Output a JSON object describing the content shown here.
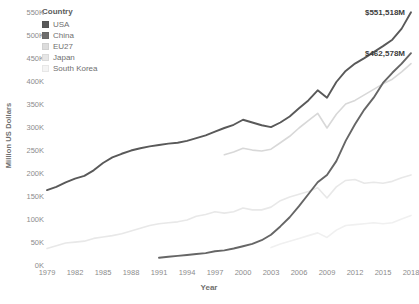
{
  "chart_data": {
    "type": "line",
    "title": "",
    "xlabel": "Year",
    "ylabel": "Million US Dollars",
    "xlim": [
      1979,
      2018
    ],
    "ylim": [
      0,
      550000
    ],
    "grid": false,
    "legend_position": "top-left",
    "legend_title": "Country",
    "x_tick_labels": [
      "1979",
      "1982",
      "1985",
      "1988",
      "1991",
      "1994",
      "1997",
      "2000",
      "2003",
      "2006",
      "2009",
      "2012",
      "2015",
      "2018"
    ],
    "x_tick_values": [
      1979,
      1982,
      1985,
      1988,
      1991,
      1994,
      1997,
      2000,
      2003,
      2006,
      2009,
      2012,
      2015,
      2018
    ],
    "y_tick_labels": [
      "0K",
      "50K",
      "100K",
      "150K",
      "200K",
      "250K",
      "300K",
      "350K",
      "400K",
      "450K",
      "500K",
      "550K"
    ],
    "y_tick_values": [
      0,
      50000,
      100000,
      150000,
      200000,
      250000,
      300000,
      350000,
      400000,
      450000,
      500000,
      550000
    ],
    "x": [
      1979,
      1980,
      1981,
      1982,
      1983,
      1984,
      1985,
      1986,
      1987,
      1988,
      1989,
      1990,
      1991,
      1992,
      1993,
      1994,
      1995,
      1996,
      1997,
      1998,
      1999,
      2000,
      2001,
      2002,
      2003,
      2004,
      2005,
      2006,
      2007,
      2008,
      2009,
      2010,
      2011,
      2012,
      2013,
      2014,
      2015,
      2016,
      2017,
      2018
    ],
    "series": [
      {
        "name": "USA",
        "color": "#595959",
        "width": 1.9,
        "values": [
          165000,
          172000,
          182000,
          190000,
          196000,
          208000,
          224000,
          236000,
          244000,
          251000,
          256000,
          260000,
          263000,
          266000,
          268000,
          272000,
          278000,
          284000,
          292000,
          300000,
          307000,
          318000,
          312000,
          306000,
          302000,
          312000,
          325000,
          343000,
          360000,
          382000,
          366000,
          400000,
          424000,
          440000,
          452000,
          465000,
          478000,
          492000,
          516000,
          551518
        ]
      },
      {
        "name": "China",
        "color": "#666666",
        "width": 1.9,
        "values": [
          null,
          null,
          null,
          null,
          null,
          null,
          null,
          null,
          null,
          null,
          null,
          null,
          18000,
          20000,
          22000,
          24000,
          26000,
          28000,
          32000,
          34000,
          38000,
          43000,
          48000,
          56000,
          68000,
          86000,
          106000,
          130000,
          156000,
          182000,
          198000,
          228000,
          272000,
          308000,
          340000,
          366000,
          398000,
          420000,
          440000,
          462578
        ]
      },
      {
        "name": "EU27",
        "color": "#d8d8d8",
        "width": 1.6,
        "values": [
          null,
          null,
          null,
          null,
          null,
          null,
          null,
          null,
          null,
          null,
          null,
          null,
          null,
          null,
          null,
          null,
          null,
          null,
          null,
          242000,
          248000,
          256000,
          252000,
          250000,
          254000,
          268000,
          282000,
          300000,
          316000,
          332000,
          300000,
          330000,
          352000,
          360000,
          372000,
          384000,
          396000,
          406000,
          422000,
          440000
        ]
      },
      {
        "name": "Japan",
        "color": "#e8e8e8",
        "width": 1.6,
        "values": [
          38000,
          44000,
          50000,
          52000,
          54000,
          60000,
          63000,
          66000,
          70000,
          76000,
          82000,
          88000,
          92000,
          94000,
          96000,
          100000,
          108000,
          112000,
          118000,
          115000,
          118000,
          126000,
          122000,
          122000,
          128000,
          142000,
          150000,
          156000,
          162000,
          170000,
          148000,
          172000,
          186000,
          188000,
          180000,
          182000,
          180000,
          184000,
          192000,
          198000
        ]
      },
      {
        "name": "South Korea",
        "color": "#f0f0f0",
        "width": 1.6,
        "values": [
          null,
          null,
          null,
          null,
          null,
          null,
          null,
          null,
          null,
          null,
          null,
          null,
          null,
          null,
          null,
          null,
          null,
          null,
          null,
          null,
          null,
          null,
          null,
          null,
          40000,
          48000,
          54000,
          60000,
          66000,
          72000,
          62000,
          78000,
          88000,
          90000,
          92000,
          94000,
          92000,
          94000,
          102000,
          110000
        ]
      }
    ],
    "annotations": [
      {
        "name": "usa-end-label",
        "text": "$551,518M",
        "x": 2018,
        "y": 551518,
        "dx": -6,
        "dy": 0
      },
      {
        "name": "china-end-label",
        "text": "$462,578M",
        "x": 2018,
        "y": 462578,
        "dx": -6,
        "dy": 0
      }
    ]
  },
  "legend": {
    "title": "Country",
    "items": [
      {
        "label": "USA",
        "color": "#595959"
      },
      {
        "label": "China",
        "color": "#6e6e6e"
      },
      {
        "label": "EU27",
        "color": "#dcdcdc"
      },
      {
        "label": "Japan",
        "color": "#e6e6e6"
      },
      {
        "label": "South Korea",
        "color": "#f4f4f4"
      }
    ]
  }
}
